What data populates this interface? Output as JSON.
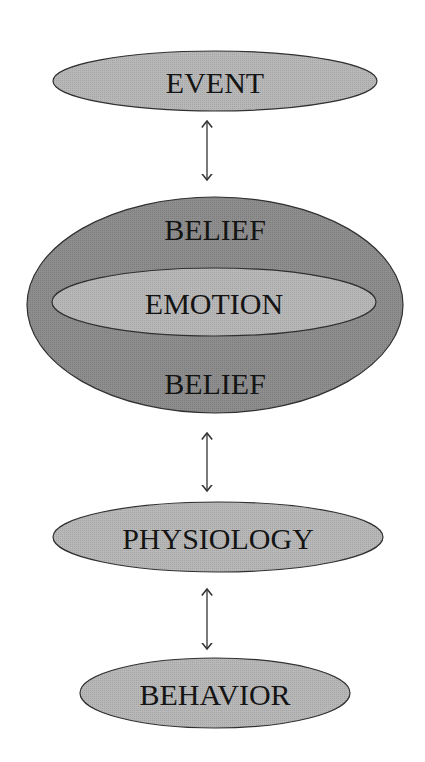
{
  "diagram": {
    "nodes": {
      "event": {
        "label": "EVENT"
      },
      "belief_top": {
        "label": "BELIEF"
      },
      "emotion": {
        "label": "EMOTION"
      },
      "belief_bottom": {
        "label": "BELIEF"
      },
      "physiology": {
        "label": "PHYSIOLOGY"
      },
      "behavior": {
        "label": "BEHAVIOR"
      }
    },
    "edges": [
      {
        "from": "EVENT",
        "to": "BELIEF",
        "type": "bidirectional"
      },
      {
        "from": "BELIEF",
        "to": "PHYSIOLOGY",
        "type": "bidirectional"
      },
      {
        "from": "PHYSIOLOGY",
        "to": "BEHAVIOR",
        "type": "bidirectional"
      }
    ],
    "colors": {
      "light_fill": "#b4b4b4",
      "dark_fill": "#8a8a8a",
      "stroke": "#303030",
      "text": "#141414"
    }
  }
}
